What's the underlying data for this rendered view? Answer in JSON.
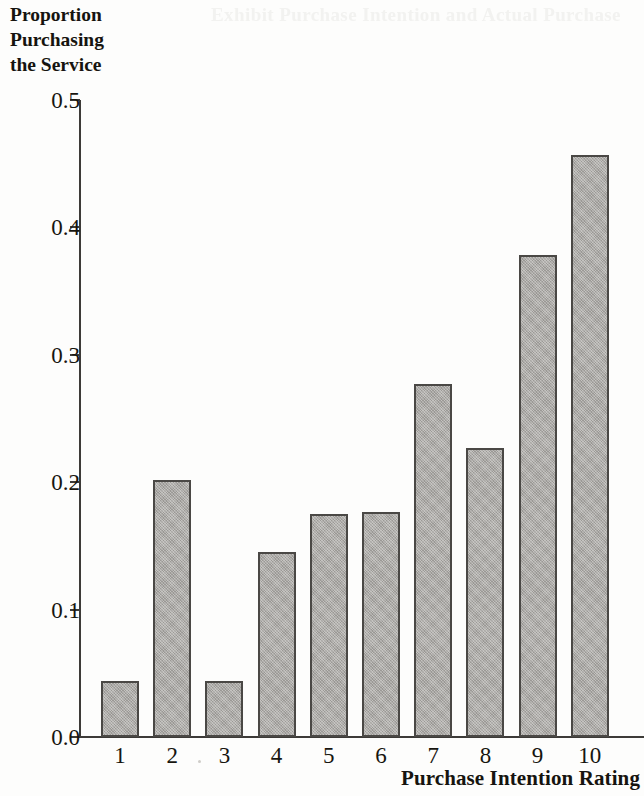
{
  "figure": {
    "y_axis_caption": "Proportion\nPurchasing\nthe Service",
    "x_axis_title": "Purchase Intention Rating",
    "bleed_through_text": "Exhibit Purchase Intention and Actual Purchase"
  },
  "chart_data": {
    "type": "bar",
    "title": "",
    "xlabel": "Purchase Intention Rating",
    "ylabel": "Proportion Purchasing the Service",
    "categories": [
      "1",
      "2",
      "3",
      "4",
      "5",
      "6",
      "7",
      "8",
      "9",
      "10"
    ],
    "values": [
      0.044,
      0.202,
      0.044,
      0.145,
      0.175,
      0.177,
      0.277,
      0.227,
      0.378,
      0.457
    ],
    "ylim": [
      0.0,
      0.5
    ],
    "ytick_labels": [
      "0.5",
      "0.4",
      "0.3",
      "0.2",
      "0.1",
      "0.0"
    ],
    "ytick_values": [
      0.5,
      0.4,
      0.3,
      0.2,
      0.1,
      0.0
    ],
    "grid": false,
    "legend": false,
    "bar_fill_color": "#a9a7a3",
    "bar_border_color": "#4a4845",
    "axis_color": "#3d3b38",
    "text_color": "#17150f"
  }
}
